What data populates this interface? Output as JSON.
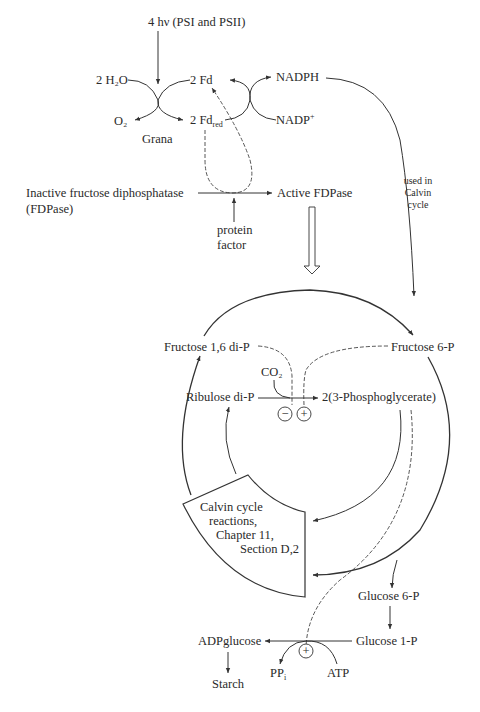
{
  "diagram": {
    "light_reactions": {
      "light_input": "4 hν (PSI and PSII)",
      "water": "2 H₂O",
      "oxygen": "O₂",
      "location": "Grana",
      "fd_ox": "2 Fd",
      "fd_red_base": "2 Fd",
      "fd_red_sub": "red",
      "nadph": "NADPH",
      "nadp_base": "NADP",
      "nadp_sup": "+"
    },
    "activation": {
      "inactive_line1": "Inactive fructose diphosphatase",
      "inactive_line2": "(FDPase)",
      "active": "Active FDPase",
      "protein_line1": "protein",
      "protein_line2": "factor"
    },
    "nadph_note": [
      "used in",
      "Calvin",
      "cycle"
    ],
    "calvin": {
      "fructose16": "Fructose 1,6 di-P",
      "fructose6": "Fructose 6-P",
      "co2": "CO₂",
      "ribulose": "Ribulose di-P",
      "pga": "2(3-Phosphoglycerate)",
      "minus": "−",
      "plus": "+",
      "box_lines": [
        "Calvin cycle",
        "reactions,",
        "Chapter 11,",
        "Section D,2"
      ]
    },
    "starch_path": {
      "g6p": "Glucose 6-P",
      "g1p": "Glucose 1-P",
      "adpglucose": "ADPglucose",
      "starch": "Starch",
      "ppi_base": "PP",
      "ppi_sub": "i",
      "atp": "ATP",
      "plus": "+"
    }
  }
}
